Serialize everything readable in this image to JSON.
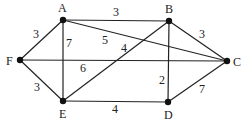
{
  "graph": {
    "nodes": [
      {
        "id": "A",
        "x": 63,
        "y": 20,
        "lx": 58,
        "ly": 12
      },
      {
        "id": "B",
        "x": 169,
        "y": 21,
        "lx": 165,
        "ly": 13
      },
      {
        "id": "C",
        "x": 227,
        "y": 61,
        "lx": 233,
        "ly": 66
      },
      {
        "id": "D",
        "x": 168,
        "y": 102,
        "lx": 164,
        "ly": 119
      },
      {
        "id": "E",
        "x": 63,
        "y": 101,
        "lx": 59,
        "ly": 118
      },
      {
        "id": "F",
        "x": 20,
        "y": 60,
        "lx": 6,
        "ly": 65
      }
    ],
    "edges": [
      {
        "from": "A",
        "to": "B",
        "weight": "3",
        "lx": 113,
        "ly": 16
      },
      {
        "from": "A",
        "to": "C",
        "weight": "5",
        "lx": 102,
        "ly": 44
      },
      {
        "from": "A",
        "to": "F",
        "weight": "3",
        "lx": 33,
        "ly": 38
      },
      {
        "from": "A",
        "to": "E",
        "weight": "7",
        "lx": 66,
        "ly": 47
      },
      {
        "from": "F",
        "to": "C",
        "weight": "6",
        "lx": 80,
        "ly": 72
      },
      {
        "from": "F",
        "to": "E",
        "weight": "3",
        "lx": 34,
        "ly": 91
      },
      {
        "from": "E",
        "to": "B",
        "weight": "4",
        "lx": 121,
        "ly": 52
      },
      {
        "from": "E",
        "to": "D",
        "weight": "4",
        "lx": 112,
        "ly": 113
      },
      {
        "from": "B",
        "to": "D",
        "weight": "2",
        "lx": 159,
        "ly": 84
      },
      {
        "from": "B",
        "to": "C",
        "weight": "3",
        "lx": 199,
        "ly": 38
      },
      {
        "from": "D",
        "to": "C",
        "weight": "7",
        "lx": 199,
        "ly": 93
      }
    ]
  }
}
